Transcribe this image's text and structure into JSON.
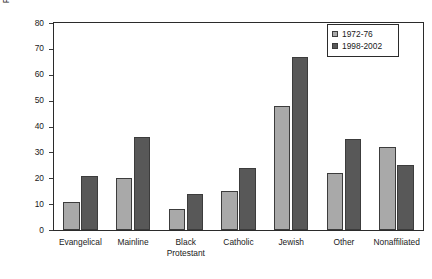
{
  "chart_data": {
    "type": "bar",
    "title": "",
    "subtitle": "",
    "xlabel": "",
    "ylabel": "Percent with a College Degree or More",
    "ylim": [
      0,
      80
    ],
    "yticks": [
      0,
      10,
      20,
      30,
      40,
      50,
      60,
      70,
      80
    ],
    "grid": false,
    "legend_position": "top-right",
    "categories": [
      "Evangelical",
      "Mainline",
      "Black\nProtestant",
      "Catholic",
      "Jewish",
      "Other",
      "Nonaffiliated"
    ],
    "series": [
      {
        "name": "1972-76",
        "color": "#a9a9a9",
        "values": [
          11,
          20,
          8,
          15,
          48,
          22,
          32
        ]
      },
      {
        "name": "1998-2002",
        "color": "#585858",
        "values": [
          21,
          36,
          14,
          24,
          67,
          35,
          25
        ]
      }
    ]
  },
  "legend": {
    "entries": [
      {
        "label": "1972-76"
      },
      {
        "label": "1998-2002"
      }
    ]
  },
  "colors": {
    "series_0": "#a9a9a9",
    "series_1": "#585858",
    "axis": "#2b2b2b",
    "text": "#1a1a1a",
    "background": "#ffffff"
  }
}
